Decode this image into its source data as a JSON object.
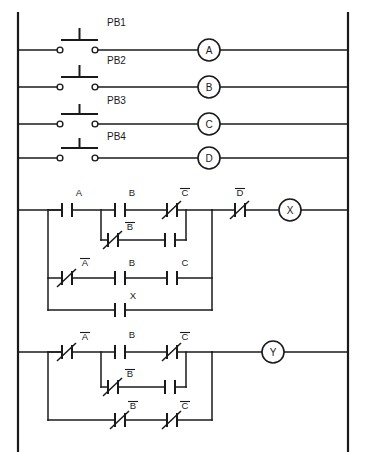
{
  "diagram": {
    "type": "ladder-logic",
    "line_color": "#1a1a1a",
    "background_color": "#ffffff"
  },
  "pushbutton_rungs": [
    {
      "pb_label": "PB1",
      "coil_label": "A"
    },
    {
      "pb_label": "PB2",
      "coil_label": "B"
    },
    {
      "pb_label": "PB3",
      "coil_label": "C"
    },
    {
      "pb_label": "PB4",
      "coil_label": "D"
    }
  ],
  "rung_x": {
    "branch_start_label": "X",
    "series_contact_label": "D",
    "series_contact_overbar": true,
    "coil_label": "X",
    "rows": [
      {
        "row": 1,
        "contacts": [
          {
            "label": "A",
            "overbar": false,
            "normally_closed": false
          },
          {
            "label": "B",
            "overbar": false,
            "normally_closed": false
          },
          {
            "label": "C",
            "overbar": true,
            "normally_closed": true
          }
        ]
      },
      {
        "row": 2,
        "contacts": [
          {
            "label": "B",
            "overbar": true,
            "normally_closed": true
          },
          {
            "label": "",
            "overbar": false,
            "normally_closed": false
          }
        ]
      },
      {
        "row": 3,
        "contacts": [
          {
            "label": "A",
            "overbar": true,
            "normally_closed": true
          },
          {
            "label": "B",
            "overbar": false,
            "normally_closed": false
          },
          {
            "label": "C",
            "overbar": false,
            "normally_closed": false
          }
        ]
      },
      {
        "row": 4,
        "contacts": [
          {
            "label": "X",
            "overbar": false,
            "normally_closed": false
          }
        ]
      }
    ]
  },
  "rung_y": {
    "coil_label": "Y",
    "rows": [
      {
        "row": 1,
        "contacts": [
          {
            "label": "A",
            "overbar": true,
            "normally_closed": true
          },
          {
            "label": "B",
            "overbar": false,
            "normally_closed": false
          },
          {
            "label": "C",
            "overbar": true,
            "normally_closed": true
          }
        ]
      },
      {
        "row": 2,
        "contacts": [
          {
            "label": "B",
            "overbar": true,
            "normally_closed": true
          },
          {
            "label": "",
            "overbar": false,
            "normally_closed": false
          }
        ]
      },
      {
        "row": 3,
        "contacts": [
          {
            "label": "B",
            "overbar": true,
            "normally_closed": true
          },
          {
            "label": "C",
            "overbar": true,
            "normally_closed": true
          }
        ]
      }
    ]
  }
}
